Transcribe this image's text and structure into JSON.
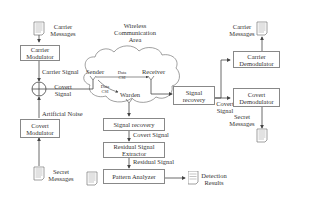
{
  "diagram": {
    "title": "Wireless Communication Area",
    "transmitter": {
      "carrier_messages": "Carrier Messages",
      "carrier_modulator": "Carrier Modulator",
      "carrier_signal": "Carrier Signal",
      "covert_signal": "Covert Signal",
      "artificial_noise": "Artificial Noise",
      "covert_modulator": "Covert Modulator",
      "secret_messages": "Secret Messages"
    },
    "channel": {
      "sender": "Sender",
      "receiver": "Receiver",
      "warden": "Warden",
      "data_csi_1": "Data CSI",
      "data_csi_2": "Data CSI"
    },
    "receiver_side": {
      "signal_recovery": "Signal recovery",
      "covert_signal": "Covert Signal",
      "carrier_demodulator": "Carrier Demodulator",
      "covert_demodulator": "Covert Demodulator",
      "carrier_messages": "Carrier Messages",
      "secret_messages": "Secret Messages"
    },
    "warden_side": {
      "signal_recovery": "Signal recovery",
      "covert_signal": "Covert Signal",
      "residual_signal_extractor": "Residual Signal Extractor",
      "residual_signal": "Residual Signal",
      "pattern_analyzer": "Pattern Analyzer",
      "detection_results": "Detection Results"
    }
  }
}
